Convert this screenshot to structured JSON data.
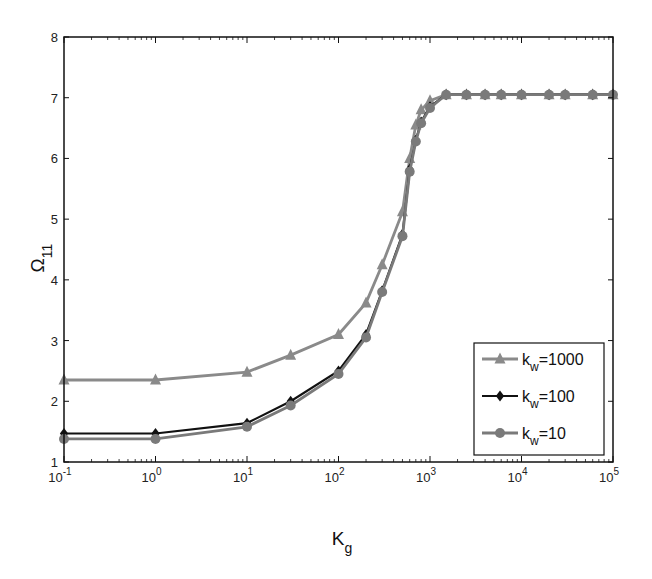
{
  "chart_data": {
    "type": "line",
    "title": "",
    "xlabel": "K",
    "xlabel_sub": "g",
    "ylabel": "Ω",
    "ylabel_sub": "11",
    "xscale": "log",
    "xlim": [
      0.1,
      100000
    ],
    "ylim": [
      1,
      8
    ],
    "grid": false,
    "legend_position": "lower right",
    "xticks": [
      {
        "base": "10",
        "exp": "-1"
      },
      {
        "base": "10",
        "exp": "0"
      },
      {
        "base": "10",
        "exp": "1"
      },
      {
        "base": "10",
        "exp": "2"
      },
      {
        "base": "10",
        "exp": "3"
      },
      {
        "base": "10",
        "exp": "4"
      },
      {
        "base": "10",
        "exp": "5"
      }
    ],
    "yticks": [
      "1",
      "2",
      "3",
      "4",
      "5",
      "6",
      "7",
      "8"
    ],
    "x": [
      0.1,
      1,
      10,
      30,
      100,
      200,
      300,
      500,
      600,
      700,
      800,
      1000,
      1500,
      2500,
      4000,
      6000,
      10000,
      20000,
      30000,
      60000,
      100000
    ],
    "series": [
      {
        "name": "k_w=1000",
        "label_main": "k",
        "label_sub": "w",
        "label_rest": "=1000",
        "color": "#8a8a8a",
        "marker": "triangle",
        "values": [
          2.35,
          2.35,
          2.48,
          2.76,
          3.1,
          3.62,
          4.25,
          5.12,
          6.0,
          6.55,
          6.8,
          6.95,
          7.05,
          7.05,
          7.05,
          7.05,
          7.05,
          7.05,
          7.05,
          7.05,
          7.05
        ]
      },
      {
        "name": "k_w=100",
        "label_main": "k",
        "label_sub": "w",
        "label_rest": "=100",
        "color": "#111111",
        "marker": "diamond",
        "values": [
          1.47,
          1.47,
          1.64,
          2.0,
          2.5,
          3.1,
          3.82,
          4.75,
          5.82,
          6.3,
          6.6,
          6.85,
          7.05,
          7.05,
          7.05,
          7.05,
          7.05,
          7.05,
          7.05,
          7.05,
          7.05
        ]
      },
      {
        "name": "k_w=10",
        "label_main": "k",
        "label_sub": "w",
        "label_rest": "=10",
        "color": "#7a7a7a",
        "marker": "circle",
        "values": [
          1.38,
          1.38,
          1.58,
          1.93,
          2.45,
          3.05,
          3.8,
          4.72,
          5.78,
          6.28,
          6.58,
          6.83,
          7.05,
          7.05,
          7.05,
          7.05,
          7.05,
          7.05,
          7.05,
          7.05,
          7.05
        ]
      }
    ]
  }
}
